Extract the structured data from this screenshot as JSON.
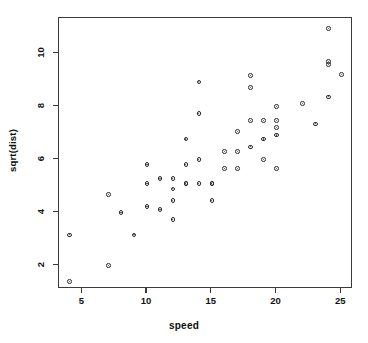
{
  "chart_data": {
    "type": "scatter",
    "title": "",
    "xlabel": "speed",
    "ylabel": "sqrt(dist)",
    "xlim": [
      3.2,
      25.9
    ],
    "ylim": [
      1.12,
      11.35
    ],
    "grid": false,
    "legend": null,
    "marker": "open-circle",
    "marker_color": "#2b2b2b",
    "xticks": [
      5,
      10,
      15,
      20,
      25
    ],
    "xtick_labels": [
      "5",
      "10",
      "15",
      "20",
      "25"
    ],
    "yticks": [
      2,
      4,
      6,
      8,
      10
    ],
    "ytick_labels": [
      "2",
      "4",
      "6",
      "8",
      "10"
    ],
    "n_points": 50,
    "x": [
      4,
      4,
      7,
      7,
      8,
      9,
      10,
      10,
      10,
      11,
      11,
      12,
      12,
      12,
      12,
      13,
      13,
      13,
      13,
      14,
      14,
      14,
      14,
      15,
      15,
      15,
      16,
      16,
      17,
      17,
      17,
      18,
      18,
      18,
      18,
      19,
      19,
      19,
      20,
      20,
      20,
      20,
      20,
      22,
      23,
      24,
      24,
      24,
      24,
      25
    ],
    "y": [
      1.41,
      3.16,
      2.0,
      4.69,
      4.0,
      3.16,
      4.24,
      5.1,
      5.83,
      4.12,
      5.29,
      3.74,
      4.47,
      4.9,
      5.29,
      5.1,
      5.1,
      5.83,
      6.78,
      5.1,
      6.0,
      7.75,
      8.94,
      4.47,
      5.1,
      5.1,
      5.66,
      6.32,
      5.66,
      6.32,
      7.07,
      6.48,
      7.48,
      8.72,
      9.17,
      6.0,
      6.78,
      7.48,
      5.66,
      6.93,
      7.21,
      7.48,
      8.0,
      8.12,
      7.35,
      8.37,
      9.59,
      9.7,
      10.95,
      9.22
    ],
    "points": [
      {
        "speed": 4,
        "sqrt_dist": 1.41
      },
      {
        "speed": 4,
        "sqrt_dist": 3.16
      },
      {
        "speed": 7,
        "sqrt_dist": 2.0
      },
      {
        "speed": 7,
        "sqrt_dist": 4.69
      },
      {
        "speed": 8,
        "sqrt_dist": 4.0
      },
      {
        "speed": 9,
        "sqrt_dist": 3.16
      },
      {
        "speed": 10,
        "sqrt_dist": 4.24
      },
      {
        "speed": 10,
        "sqrt_dist": 5.1
      },
      {
        "speed": 10,
        "sqrt_dist": 5.83
      },
      {
        "speed": 11,
        "sqrt_dist": 4.12
      },
      {
        "speed": 11,
        "sqrt_dist": 5.29
      },
      {
        "speed": 12,
        "sqrt_dist": 3.74
      },
      {
        "speed": 12,
        "sqrt_dist": 4.47
      },
      {
        "speed": 12,
        "sqrt_dist": 4.9
      },
      {
        "speed": 12,
        "sqrt_dist": 5.29
      },
      {
        "speed": 13,
        "sqrt_dist": 5.1
      },
      {
        "speed": 13,
        "sqrt_dist": 5.1
      },
      {
        "speed": 13,
        "sqrt_dist": 5.83
      },
      {
        "speed": 13,
        "sqrt_dist": 6.78
      },
      {
        "speed": 14,
        "sqrt_dist": 5.1
      },
      {
        "speed": 14,
        "sqrt_dist": 6.0
      },
      {
        "speed": 14,
        "sqrt_dist": 7.75
      },
      {
        "speed": 14,
        "sqrt_dist": 8.94
      },
      {
        "speed": 15,
        "sqrt_dist": 4.47
      },
      {
        "speed": 15,
        "sqrt_dist": 5.1
      },
      {
        "speed": 15,
        "sqrt_dist": 5.1
      },
      {
        "speed": 16,
        "sqrt_dist": 5.66
      },
      {
        "speed": 16,
        "sqrt_dist": 6.32
      },
      {
        "speed": 17,
        "sqrt_dist": 5.66
      },
      {
        "speed": 17,
        "sqrt_dist": 6.32
      },
      {
        "speed": 17,
        "sqrt_dist": 7.07
      },
      {
        "speed": 18,
        "sqrt_dist": 6.48
      },
      {
        "speed": 18,
        "sqrt_dist": 7.48
      },
      {
        "speed": 18,
        "sqrt_dist": 8.72
      },
      {
        "speed": 18,
        "sqrt_dist": 9.17
      },
      {
        "speed": 19,
        "sqrt_dist": 6.0
      },
      {
        "speed": 19,
        "sqrt_dist": 6.78
      },
      {
        "speed": 19,
        "sqrt_dist": 7.48
      },
      {
        "speed": 20,
        "sqrt_dist": 5.66
      },
      {
        "speed": 20,
        "sqrt_dist": 6.93
      },
      {
        "speed": 20,
        "sqrt_dist": 7.21
      },
      {
        "speed": 20,
        "sqrt_dist": 7.48
      },
      {
        "speed": 20,
        "sqrt_dist": 8.0
      },
      {
        "speed": 22,
        "sqrt_dist": 8.12
      },
      {
        "speed": 23,
        "sqrt_dist": 7.35
      },
      {
        "speed": 24,
        "sqrt_dist": 8.37
      },
      {
        "speed": 24,
        "sqrt_dist": 9.59
      },
      {
        "speed": 24,
        "sqrt_dist": 9.7
      },
      {
        "speed": 24,
        "sqrt_dist": 10.95
      },
      {
        "speed": 25,
        "sqrt_dist": 9.22
      }
    ]
  },
  "style": {
    "frame_color": "#3a3a3a",
    "text_color": "#0d0d0d",
    "background": "#ffffff"
  }
}
